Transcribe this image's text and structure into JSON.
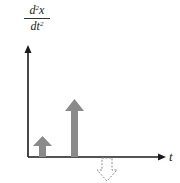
{
  "diagram": {
    "y_axis_label": {
      "numerator": "d",
      "numerator_sup": "2",
      "numerator_var": "x",
      "denominator": "dt",
      "denominator_sup": "2"
    },
    "x_axis_label": "t",
    "colors": {
      "axis": "#1a1a1a",
      "impulse_fill": "#8a8a8a",
      "dashed_impulse_stroke": "#8a8a8a"
    },
    "impulses": [
      {
        "name": "small-positive-impulse",
        "direction": "up",
        "style": "solid",
        "relative_height": 1
      },
      {
        "name": "large-positive-impulse",
        "direction": "up",
        "style": "solid",
        "relative_height": 3
      },
      {
        "name": "negative-impulse",
        "direction": "down",
        "style": "dashed",
        "relative_height": 1
      }
    ]
  }
}
